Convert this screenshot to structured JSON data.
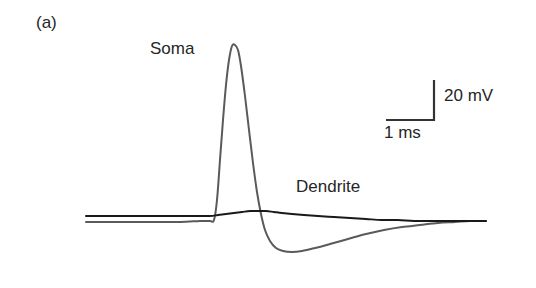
{
  "figure": {
    "panel_letter": "(a)",
    "background_color": "#ffffff"
  },
  "labels": {
    "soma": "Soma",
    "dendrite": "Dendrite"
  },
  "scale_bar": {
    "voltage_label": "20 mV",
    "time_label": "1 ms",
    "voltage_value": 20,
    "voltage_unit": "mV",
    "time_value": 1,
    "time_unit": "ms",
    "corner_x": 434,
    "corner_y": 120,
    "vertical_top_y": 80,
    "horizontal_left_x": 386,
    "color": "#333333"
  },
  "chart_data": {
    "type": "line",
    "title": "",
    "subtitle": "",
    "xlabel": "",
    "ylabel": "",
    "grid": false,
    "axes_visible": false,
    "legend_position": "inline-annotations",
    "x_unit": "ms",
    "y_unit": "mV",
    "pixels_per_ms": 48,
    "pixels_per_mV": 2.0,
    "baseline_pixel_y": {
      "dendrite": 216,
      "soma": 222
    },
    "annotations": [
      {
        "text": "Soma",
        "x_px": 150,
        "y_px": 40
      },
      {
        "text": "Dendrite",
        "x_px": 296,
        "y_px": 178
      },
      {
        "text": "20 mV",
        "x_px": 444,
        "y_px": 87
      },
      {
        "text": "1 ms",
        "x_px": 384,
        "y_px": 124
      },
      {
        "text": "(a)",
        "x_px": 36,
        "y_px": 14
      }
    ],
    "series": [
      {
        "name": "Soma",
        "color": "#5a5a5a",
        "line_width": 2.0,
        "description": "Somatic action potential: fast large-amplitude spike with pronounced afterhyperpolarization",
        "peak_px": {
          "x": 232,
          "y": 45
        },
        "trough_px": {
          "x": 292,
          "y": 252
        },
        "peak_amplitude_mV": 88,
        "undershoot_amplitude_mV": -15,
        "points_px": [
          [
            86,
            222
          ],
          [
            120,
            222
          ],
          [
            150,
            222
          ],
          [
            180,
            222
          ],
          [
            200,
            221
          ],
          [
            210,
            221
          ],
          [
            214,
            220
          ],
          [
            217,
            200
          ],
          [
            220,
            160
          ],
          [
            223,
            120
          ],
          [
            226,
            85
          ],
          [
            229,
            60
          ],
          [
            232,
            46
          ],
          [
            235,
            45
          ],
          [
            238,
            50
          ],
          [
            241,
            66
          ],
          [
            245,
            96
          ],
          [
            249,
            130
          ],
          [
            253,
            163
          ],
          [
            257,
            192
          ],
          [
            261,
            214
          ],
          [
            265,
            230
          ],
          [
            270,
            241
          ],
          [
            276,
            248
          ],
          [
            283,
            251
          ],
          [
            292,
            252
          ],
          [
            302,
            251
          ],
          [
            315,
            248
          ],
          [
            330,
            244
          ],
          [
            348,
            239
          ],
          [
            366,
            234
          ],
          [
            384,
            230
          ],
          [
            402,
            227
          ],
          [
            420,
            225
          ],
          [
            438,
            223
          ],
          [
            455,
            222
          ],
          [
            470,
            221
          ],
          [
            486,
            221
          ]
        ]
      },
      {
        "name": "Dendrite",
        "color": "#1a1a1a",
        "line_width": 2.0,
        "description": "Dendritic backpropagating potential: small slow broad depolarization followed by shallow slow decay",
        "peak_px": {
          "x": 256,
          "y": 211
        },
        "peak_amplitude_mV": 2.5,
        "points_px": [
          [
            86,
            216
          ],
          [
            110,
            216
          ],
          [
            140,
            216
          ],
          [
            170,
            216
          ],
          [
            195,
            216
          ],
          [
            210,
            216
          ],
          [
            218,
            215
          ],
          [
            226,
            214
          ],
          [
            234,
            213
          ],
          [
            242,
            212
          ],
          [
            250,
            211
          ],
          [
            258,
            211
          ],
          [
            266,
            211
          ],
          [
            274,
            212
          ],
          [
            282,
            213
          ],
          [
            292,
            214
          ],
          [
            304,
            215
          ],
          [
            318,
            216
          ],
          [
            334,
            217
          ],
          [
            350,
            218
          ],
          [
            366,
            219
          ],
          [
            382,
            220
          ],
          [
            398,
            220
          ],
          [
            414,
            221
          ],
          [
            432,
            221
          ],
          [
            450,
            221
          ],
          [
            468,
            221
          ],
          [
            486,
            221
          ]
        ]
      }
    ]
  }
}
